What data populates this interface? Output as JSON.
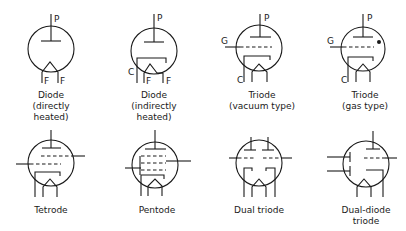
{
  "symbols": [
    {
      "id": "diode-direct",
      "label_lines": [
        "Diode",
        "(directly",
        "heated)"
      ],
      "pins": [
        "P",
        "F",
        "F"
      ]
    },
    {
      "id": "diode-indirect",
      "label_lines": [
        "Diode",
        "(indirectly",
        "heated)"
      ],
      "pins": [
        "P",
        "C",
        "F",
        "F"
      ]
    },
    {
      "id": "triode-vacuum",
      "label_lines": [
        "Triode",
        "(vacuum type)"
      ],
      "pins": [
        "P",
        "G",
        "C"
      ]
    },
    {
      "id": "triode-gas",
      "label_lines": [
        "Triode",
        "(gas type)"
      ],
      "pins": [
        "P",
        "G",
        "C"
      ]
    },
    {
      "id": "tetrode",
      "label_lines": [
        "Tetrode"
      ],
      "pins": []
    },
    {
      "id": "pentode",
      "label_lines": [
        "Pentode"
      ],
      "pins": []
    },
    {
      "id": "dual-triode",
      "label_lines": [
        "Dual triode"
      ],
      "pins": []
    },
    {
      "id": "dual-diode-triode",
      "label_lines": [
        "Dual-diode",
        "triode"
      ],
      "pins": []
    }
  ]
}
